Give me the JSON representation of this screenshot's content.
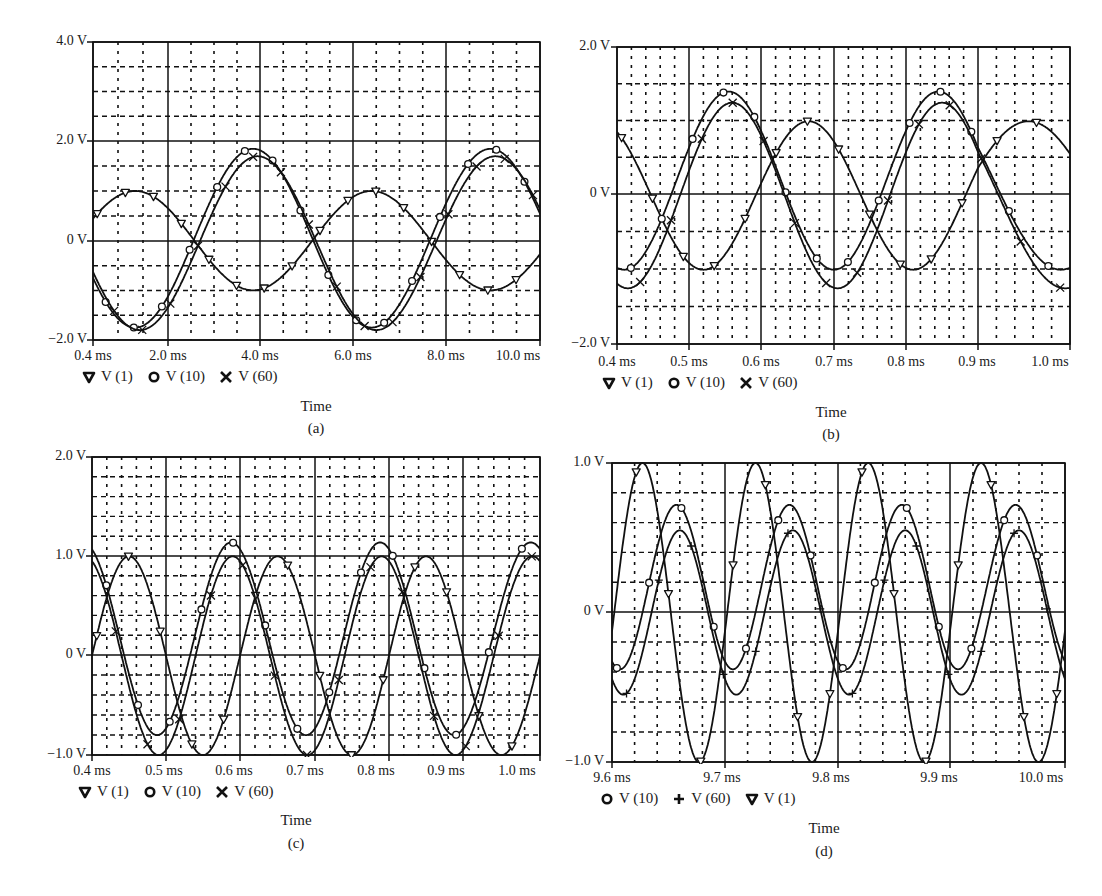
{
  "figure": {
    "panels": [
      {
        "id": "a",
        "label": "(a)",
        "xtitle": "Time",
        "yticks": [
          "4.0 V",
          "2.0 V",
          "0 V",
          "−2.0 V"
        ],
        "xticks": [
          "0.4 ms",
          "2.0 ms",
          "4.0 ms",
          "6.0 ms",
          "8.0 ms",
          "10.0 ms"
        ],
        "legend": [
          {
            "marker": "triangle-down",
            "label": "V (1)"
          },
          {
            "marker": "circle",
            "label": "V (10)"
          },
          {
            "marker": "x",
            "label": "V (60)"
          }
        ]
      },
      {
        "id": "b",
        "label": "(b)",
        "xtitle": "Time",
        "yticks": [
          "2.0 V",
          "0 V",
          "−2.0 V"
        ],
        "xticks": [
          "0.4 ms",
          "0.5 ms",
          "0.6 ms",
          "0.7 ms",
          "0.8 ms",
          "0.9 ms",
          "1.0 ms"
        ],
        "legend": [
          {
            "marker": "triangle-down",
            "label": "V (1)"
          },
          {
            "marker": "circle",
            "label": "V (10)"
          },
          {
            "marker": "x",
            "label": "V (60)"
          }
        ]
      },
      {
        "id": "c",
        "label": "(c)",
        "xtitle": "Time",
        "yticks": [
          "2.0 V",
          "1.0 V",
          "0 V",
          "−1.0 V"
        ],
        "xticks": [
          "0.4 ms",
          "0.5 ms",
          "0.6 ms",
          "0.7 ms",
          "0.8 ms",
          "0.9 ms",
          "1.0 ms"
        ],
        "legend": [
          {
            "marker": "triangle-down",
            "label": "V (1)"
          },
          {
            "marker": "circle",
            "label": "V (10)"
          },
          {
            "marker": "x",
            "label": "V (60)"
          }
        ]
      },
      {
        "id": "d",
        "label": "(d)",
        "xtitle": "Time",
        "yticks": [
          "1.0 V",
          "0 V",
          "−1.0 V"
        ],
        "xticks": [
          "9.6 ms",
          "9.7 ms",
          "9.8 ms",
          "9.9 ms",
          "10.0 ms"
        ],
        "legend": [
          {
            "marker": "circle",
            "label": "V (10)"
          },
          {
            "marker": "plus",
            "label": "V (60)"
          },
          {
            "marker": "triangle-down",
            "label": "V (1)"
          }
        ]
      }
    ],
    "colors": {
      "line": "#111111",
      "grid": "#111111",
      "background": "#ffffff"
    }
  },
  "chart_data": [
    {
      "type": "line",
      "panel": "a",
      "title": "",
      "xlabel": "Time",
      "ylabel": "",
      "xlim": [
        0.4,
        10.0
      ],
      "ylim": [
        -2.0,
        4.0
      ],
      "x_unit": "ms",
      "y_unit": "V",
      "xtick_values": [
        0.4,
        2.0,
        4.0,
        6.0,
        8.0,
        10.0
      ],
      "ytick_values": [
        4.0,
        2.0,
        0,
        -2.0
      ],
      "grid": true,
      "legend_position": "bottom-left",
      "series": [
        {
          "name": "V (1)",
          "marker": "triangle-down",
          "amplitude": 1.0,
          "offset": 0.0,
          "period_ms": 5.1,
          "peak_at_ms": 1.3
        },
        {
          "name": "V (10)",
          "marker": "circle",
          "amplitude": 1.8,
          "offset": 0.05,
          "period_ms": 5.1,
          "peak_at_ms": 3.85
        },
        {
          "name": "V (60)",
          "marker": "x",
          "amplitude": 1.75,
          "offset": -0.05,
          "period_ms": 5.1,
          "peak_at_ms": 3.95
        }
      ]
    },
    {
      "type": "line",
      "panel": "b",
      "title": "",
      "xlabel": "Time",
      "ylabel": "",
      "xlim": [
        0.4,
        1.0
      ],
      "ylim": [
        -2.0,
        2.0
      ],
      "x_unit": "ms",
      "y_unit": "V",
      "xtick_values": [
        0.4,
        0.5,
        0.6,
        0.7,
        0.8,
        0.9,
        1.0
      ],
      "ytick_values": [
        2.0,
        0,
        -2.0
      ],
      "grid": true,
      "legend_position": "bottom-left",
      "series": [
        {
          "name": "V (1)",
          "marker": "triangle-down",
          "amplitude": 1.0,
          "offset": 0.0,
          "period_ms": 0.29,
          "peak_at_ms": 0.665
        },
        {
          "name": "V (10)",
          "marker": "circle",
          "amplitude": 1.2,
          "offset": 0.2,
          "period_ms": 0.29,
          "peak_at_ms": 0.555
        },
        {
          "name": "V (60)",
          "marker": "x",
          "amplitude": 1.25,
          "offset": 0.0,
          "period_ms": 0.29,
          "peak_at_ms": 0.56
        }
      ]
    },
    {
      "type": "line",
      "panel": "c",
      "title": "",
      "xlabel": "Time",
      "ylabel": "",
      "xlim": [
        0.4,
        1.0
      ],
      "ylim": [
        -1.0,
        2.0
      ],
      "x_unit": "ms",
      "y_unit": "V",
      "xtick_values": [
        0.4,
        0.5,
        0.6,
        0.7,
        0.8,
        0.9,
        1.0
      ],
      "ytick_values": [
        2.0,
        1.0,
        0,
        -1.0
      ],
      "grid": true,
      "legend_position": "bottom-left",
      "series": [
        {
          "name": "V (1)",
          "marker": "triangle-down",
          "amplitude": 1.0,
          "offset": 0.0,
          "period_ms": 0.2,
          "peak_at_ms": 0.45
        },
        {
          "name": "V (10)",
          "marker": "circle",
          "amplitude": 0.97,
          "offset": 0.17,
          "period_ms": 0.2,
          "peak_at_ms": 0.588
        },
        {
          "name": "V (60)",
          "marker": "x",
          "amplitude": 1.0,
          "offset": 0.0,
          "period_ms": 0.2,
          "peak_at_ms": 0.59
        }
      ]
    },
    {
      "type": "line",
      "panel": "d",
      "title": "",
      "xlabel": "Time",
      "ylabel": "",
      "xlim": [
        9.6,
        10.0
      ],
      "ylim": [
        -1.0,
        1.0
      ],
      "x_unit": "ms",
      "y_unit": "V",
      "xtick_values": [
        9.6,
        9.7,
        9.8,
        9.9,
        10.0
      ],
      "ytick_values": [
        1.0,
        0,
        -1.0
      ],
      "grid": true,
      "legend_position": "bottom-left",
      "series": [
        {
          "name": "V (10)",
          "marker": "circle",
          "amplitude": 0.55,
          "offset": 0.17,
          "period_ms": 0.1,
          "peak_at_ms": 9.657
        },
        {
          "name": "V (60)",
          "marker": "plus",
          "amplitude": 0.55,
          "offset": 0.0,
          "period_ms": 0.1,
          "peak_at_ms": 9.66
        },
        {
          "name": "V (1)",
          "marker": "triangle-down",
          "amplitude": 1.0,
          "offset": 0.0,
          "period_ms": 0.1,
          "peak_at_ms": 9.627
        }
      ]
    }
  ]
}
